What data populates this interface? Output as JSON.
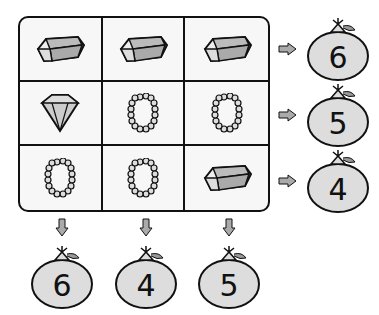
{
  "puzzle": {
    "grid": [
      [
        "gold-bar",
        "gold-bar",
        "gold-bar"
      ],
      [
        "diamond",
        "pearl-necklace",
        "pearl-necklace"
      ],
      [
        "pearl-necklace",
        "pearl-necklace",
        "gold-bar"
      ]
    ],
    "row_sums": [
      "6",
      "5",
      "4"
    ],
    "column_sums": [
      "6",
      "4",
      "5"
    ]
  },
  "colors": {
    "fill": "#d9d9d9",
    "outline": "#111111",
    "background": "#ffffff"
  }
}
